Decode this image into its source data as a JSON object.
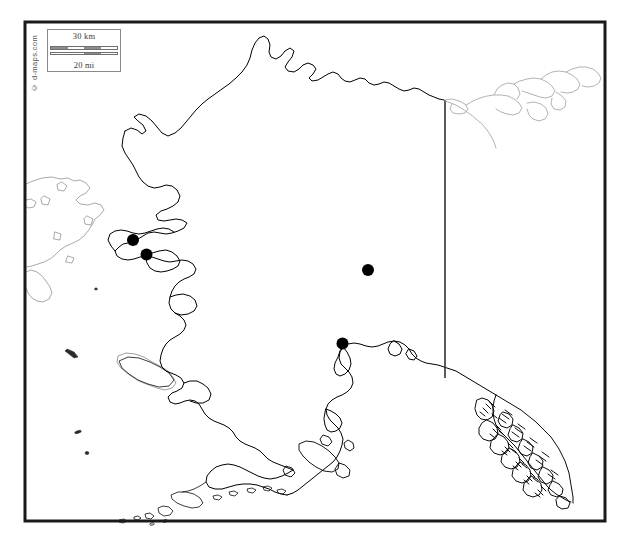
{
  "map": {
    "title": "Alaska outline map with point locations",
    "region": "Alaska, United States",
    "background_color": "#ffffff",
    "frame": {
      "color": "#1a1a1a",
      "stroke_width": 3,
      "x": 25,
      "y": 22,
      "width": 580,
      "height": 499
    },
    "coastline": {
      "primary_color": "#000000",
      "secondary_color": "#9a9a9a",
      "stroke_width": 0.9
    },
    "border_line": {
      "name": "alaska-canada-border",
      "color": "#333333",
      "stroke_width": 1.6
    }
  },
  "scale_bar": {
    "km_label": "30 km",
    "mi_label": "20 mi",
    "segment_count": 4,
    "border_color": "#8a8a8a",
    "bar_color": "#8d8d8d"
  },
  "attribution": {
    "text": "© d-maps.com",
    "color": "#555555"
  },
  "points": [
    {
      "id": "point-1",
      "label": "",
      "x": 133,
      "y": 240,
      "r": 6.0,
      "color": "#000000"
    },
    {
      "id": "point-2",
      "label": "",
      "x": 146.5,
      "y": 254.5,
      "r": 6.0,
      "color": "#000000"
    },
    {
      "id": "point-3",
      "label": "",
      "x": 368,
      "y": 270,
      "r": 6.0,
      "color": "#000000"
    },
    {
      "id": "point-4",
      "label": "",
      "x": 342.5,
      "y": 343.5,
      "r": 6.0,
      "color": "#000000"
    }
  ]
}
